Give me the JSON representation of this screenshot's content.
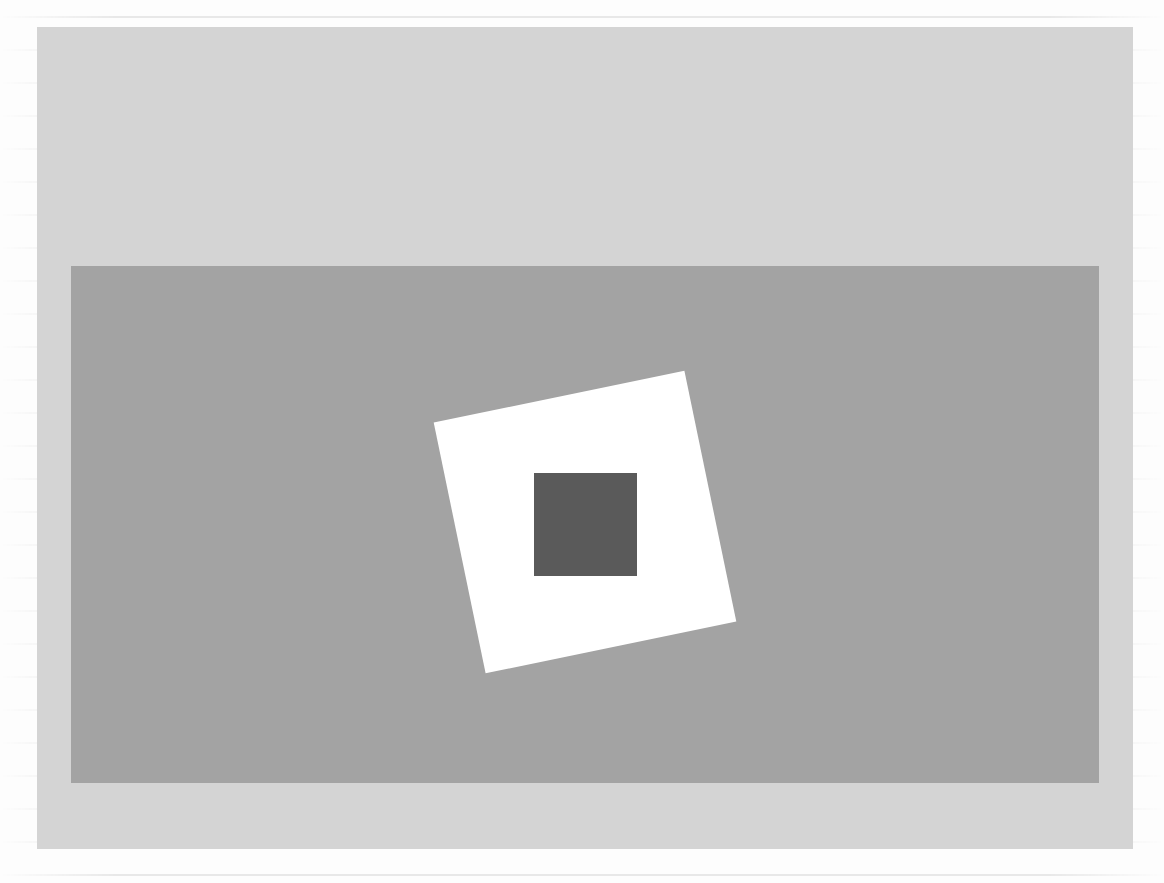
{
  "scene": {
    "window_background_color": "#d4d4d4",
    "canvas_background_color": "#a3a3a3",
    "shapes": [
      {
        "name": "spinning-square",
        "fill": "#ffffff",
        "size_px": 256,
        "rotation_deg": -11.7,
        "corners": [
          [
            434,
            424
          ],
          [
            685,
            372
          ],
          [
            735,
            615
          ],
          [
            485,
            677
          ]
        ]
      },
      {
        "name": "center-square",
        "fill": "#5a5a5a",
        "size_px": 103,
        "rotation_deg": 0,
        "bounds": [
          534,
          473,
          637,
          576
        ]
      }
    ]
  }
}
